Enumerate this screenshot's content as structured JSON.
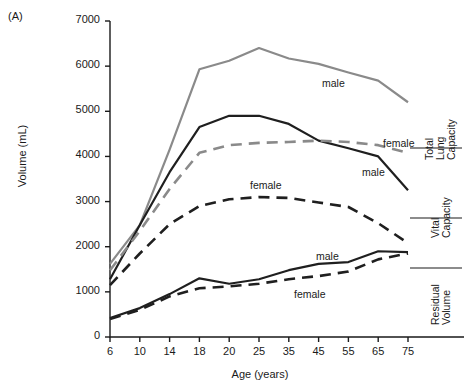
{
  "panel": {
    "letter": "(A)"
  },
  "top_cut_text": "",
  "axes": {
    "ylabel": "Volume (mL)",
    "xlabel": "Age (years)",
    "yticks": [
      0,
      1000,
      2000,
      3000,
      4000,
      5000,
      6000,
      7000
    ],
    "xticks": [
      6,
      10,
      14,
      18,
      20,
      25,
      35,
      45,
      55,
      65,
      75
    ]
  },
  "colors": {
    "male_tlc": "#8a8a8a",
    "female_tlc": "#8a8a8a",
    "male_dark": "#1f1f1f",
    "female_dark": "#1f1f1f",
    "axis": "#1a1a1a"
  },
  "annotations": [
    {
      "name": "tlc-male-label",
      "text": "male",
      "x": 322,
      "y": 77
    },
    {
      "name": "tlc-female-label",
      "text": "female",
      "x": 383,
      "y": 137
    },
    {
      "name": "vc-male-label",
      "text": "male",
      "x": 362,
      "y": 166
    },
    {
      "name": "vc-female-label",
      "text": "female",
      "x": 250,
      "y": 179
    },
    {
      "name": "rv-male-label",
      "text": "male",
      "x": 316,
      "y": 250
    },
    {
      "name": "rv-female-label",
      "text": "female",
      "x": 294,
      "y": 288
    }
  ],
  "right_labels": [
    {
      "name": "total-lung-capacity-label",
      "lines": [
        "Total",
        "Lung",
        "Capacity"
      ],
      "x": 424,
      "y": 160,
      "rule_y": 148,
      "rule_x1": 410,
      "rule_x2": 462
    },
    {
      "name": "vital-capacity-label",
      "lines": [
        "Vital",
        "Capacity"
      ],
      "x": 430,
      "y": 238,
      "rule_y": 218,
      "rule_x1": 410,
      "rule_x2": 462
    },
    {
      "name": "residual-volume-label",
      "lines": [
        "Residual",
        "Volume"
      ],
      "x": 430,
      "y": 325,
      "rule_y": 268,
      "rule_x1": 410,
      "rule_x2": 462
    }
  ],
  "chart_data": {
    "type": "line",
    "title": "",
    "xlabel": "Age (years)",
    "ylabel": "Volume (mL)",
    "xlim": [
      6,
      75
    ],
    "ylim": [
      0,
      7000
    ],
    "grid": false,
    "legend": "inline-annotations",
    "x": [
      6,
      10,
      14,
      18,
      20,
      25,
      35,
      45,
      55,
      65,
      75
    ],
    "series": [
      {
        "name": "Total Lung Capacity - male",
        "group": "Total Lung Capacity",
        "sex": "male",
        "color": "#8a8a8a",
        "style": "solid",
        "values": [
          1620,
          2480,
          4150,
          5930,
          6120,
          6400,
          6170,
          6050,
          5860,
          5680,
          5200
        ]
      },
      {
        "name": "Vital Capacity - male",
        "group": "Vital Capacity",
        "sex": "male",
        "color": "#1f1f1f",
        "style": "solid",
        "values": [
          1280,
          2480,
          3650,
          4650,
          4900,
          4900,
          4720,
          4350,
          4180,
          4000,
          3250
        ]
      },
      {
        "name": "Vital Capacity / TLC - female",
        "group": "Total Lung Capacity",
        "sex": "female",
        "color": "#8a8a8a",
        "style": "dashed",
        "values": [
          1480,
          2350,
          3280,
          4080,
          4250,
          4300,
          4320,
          4350,
          4320,
          4250,
          4080
        ]
      },
      {
        "name": "Vital Capacity - female",
        "group": "Vital Capacity",
        "sex": "female",
        "color": "#1f1f1f",
        "style": "dashed",
        "values": [
          1150,
          1850,
          2500,
          2900,
          3050,
          3100,
          3080,
          2980,
          2880,
          2520,
          2080
        ]
      },
      {
        "name": "Residual Volume - male",
        "group": "Residual Volume",
        "sex": "male",
        "color": "#1f1f1f",
        "style": "solid",
        "values": [
          420,
          640,
          950,
          1300,
          1180,
          1280,
          1480,
          1620,
          1660,
          1900,
          1880
        ]
      },
      {
        "name": "Residual Volume - female",
        "group": "Residual Volume",
        "sex": "female",
        "color": "#1f1f1f",
        "style": "dashed",
        "values": [
          400,
          600,
          900,
          1080,
          1120,
          1180,
          1280,
          1350,
          1450,
          1720,
          1850
        ]
      }
    ]
  }
}
